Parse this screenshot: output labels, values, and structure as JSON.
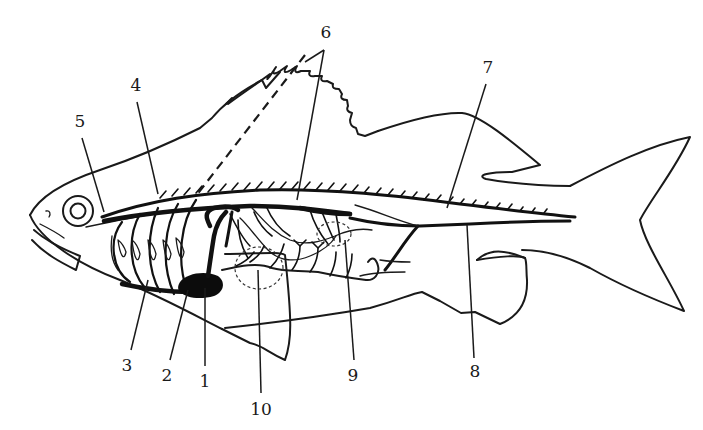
{
  "diagram": {
    "colors": {
      "ink": "#1a1a1a",
      "background": "#ffffff",
      "heart": "#0c0c0c"
    },
    "labels": [
      {
        "id": "1",
        "text": "1",
        "x": 205,
        "y": 381,
        "line": [
          205,
          366,
          205,
          288
        ]
      },
      {
        "id": "2",
        "text": "2",
        "x": 167,
        "y": 375,
        "line": [
          170,
          360,
          188,
          290
        ]
      },
      {
        "id": "3",
        "text": "3",
        "x": 127,
        "y": 365,
        "line": [
          131,
          350,
          148,
          280
        ]
      },
      {
        "id": "4",
        "text": "4",
        "x": 136,
        "y": 85,
        "line": [
          137,
          102,
          158,
          194
        ]
      },
      {
        "id": "5",
        "text": "5",
        "x": 80,
        "y": 121,
        "line": [
          82,
          138,
          104,
          212
        ]
      },
      {
        "id": "6",
        "text": "6",
        "x": 326,
        "y": 32,
        "line": [
          324,
          50,
          297,
          200
        ]
      },
      {
        "id": "7",
        "text": "7",
        "x": 488,
        "y": 67,
        "line": [
          486,
          84,
          447,
          208
        ]
      },
      {
        "id": "8",
        "text": "8",
        "x": 475,
        "y": 371,
        "line": [
          474,
          358,
          467,
          225
        ]
      },
      {
        "id": "9",
        "text": "9",
        "x": 353,
        "y": 375,
        "line": [
          354,
          360,
          345,
          240
        ]
      },
      {
        "id": "10",
        "text": "10",
        "x": 261,
        "y": 409,
        "line": [
          261,
          393,
          258,
          270
        ]
      }
    ]
  }
}
